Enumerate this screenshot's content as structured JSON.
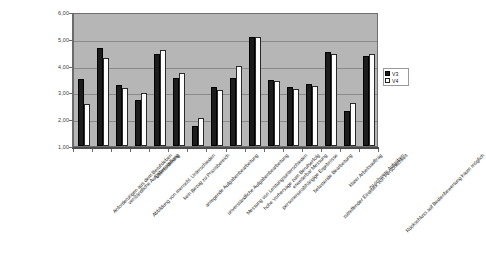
{
  "chart_data": {
    "type": "bar",
    "title": "",
    "subtitle": "",
    "xlabel": "",
    "ylabel": "",
    "ylim": [
      1.0,
      6.0
    ],
    "ytick_labels": [
      "6,00",
      "5,00",
      "4,00",
      "3,00",
      "2,00",
      "1,00"
    ],
    "ytick_values": [
      6.0,
      5.0,
      4.0,
      3.0,
      2.0,
      1.0
    ],
    "grid": true,
    "legend_position": "right",
    "categories": [
      "Anforderungen aus dem Berufsleben",
      "verständliche Aufgabenstellung",
      "Abbildung von menschl. Unterschieden",
      "Überforderung",
      "kein Bezug zu Praxisbereich",
      "anregende Aufgabenbearbeitung",
      "unverständliche Aufgabenbearbeitung",
      "Messung von Leistungsunterschieden",
      "hohe Vorhersage zum Berufserfolg",
      "personenunabhängige Ergebnisse",
      "erweiterbar Messung",
      "belastende Bearbeitung",
      "zutreffender Eindruck von Persönlichkeit",
      "klarer Arbeitsauftrag",
      "zu schwere Aufgaben",
      "Rückschluss auf Bedienbewertung kaum möglich"
    ],
    "series": [
      {
        "name": "V3",
        "color": "#1c1c1c",
        "values": [
          3.5,
          4.65,
          3.28,
          2.7,
          4.45,
          3.55,
          1.75,
          3.2,
          3.55,
          5.05,
          3.45,
          3.2,
          3.3,
          4.5,
          2.3,
          4.35
        ]
      },
      {
        "name": "V4",
        "color": "#ffffff",
        "values": [
          2.55,
          4.3,
          3.15,
          2.97,
          4.58,
          3.72,
          2.05,
          3.1,
          4.0,
          5.05,
          3.42,
          3.12,
          3.25,
          4.45,
          2.62,
          4.45
        ]
      }
    ]
  },
  "legend": {
    "items": [
      {
        "label": "V3"
      },
      {
        "label": "V4"
      }
    ]
  }
}
